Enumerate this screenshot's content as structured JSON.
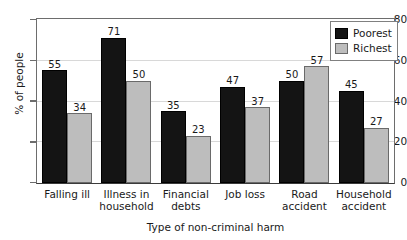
{
  "chart_data": {
    "type": "bar",
    "title": "",
    "xlabel": "Type of non-criminal harm",
    "ylabel": "% of people",
    "ylim": [
      0,
      80
    ],
    "yticks": [
      0,
      20,
      40,
      60,
      80
    ],
    "grid": true,
    "legend_position": "top-right",
    "categories": [
      "Falling ill",
      "Illness in household",
      "Financial debts",
      "Job loss",
      "Road accident",
      "Household accident"
    ],
    "category_lines": [
      [
        "Falling ill"
      ],
      [
        "Illness in",
        "household"
      ],
      [
        "Financial",
        "debts"
      ],
      [
        "Job loss"
      ],
      [
        "Road",
        "accident"
      ],
      [
        "Household",
        "accident"
      ]
    ],
    "series": [
      {
        "name": "Poorest",
        "color": "#141414",
        "values": [
          55,
          71,
          35,
          47,
          50,
          45
        ]
      },
      {
        "name": "Richest",
        "color": "#bdbdbd",
        "values": [
          34,
          50,
          23,
          37,
          57,
          27
        ]
      }
    ]
  },
  "legend": {
    "items": [
      {
        "label": "Poorest",
        "swatch": "poorest"
      },
      {
        "label": "Richest",
        "swatch": "richest"
      }
    ]
  },
  "axis": {
    "y_title": "% of people",
    "x_title": "Type of non-criminal harm",
    "y_tick_labels": [
      "0",
      "20",
      "40",
      "60",
      "80"
    ]
  }
}
